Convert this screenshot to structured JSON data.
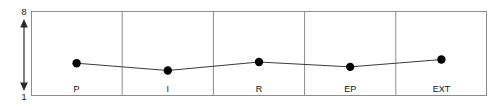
{
  "chart_data": {
    "type": "line",
    "title": "",
    "subtitle": "",
    "xlabel": "",
    "ylabel": "",
    "categories": [
      "P",
      "I",
      "R",
      "EP",
      "EXT"
    ],
    "values": [
      3.7,
      3.1,
      3.8,
      3.4,
      4.0
    ],
    "series": [
      {
        "name": "",
        "values": [
          3.7,
          3.1,
          3.8,
          3.4,
          4.0
        ]
      }
    ],
    "ylim": [
      1,
      8
    ],
    "y_axis_ticks": [
      "8",
      "1"
    ],
    "y_axis_max_label": "8",
    "y_axis_min_label": "1",
    "grid": false,
    "legend": false,
    "legend_position": "none",
    "annotations": [],
    "marker": "filled-circle",
    "marker_color": "#000000",
    "line_color": "#3a3a3a",
    "frame_color": "#8c8c8c",
    "divider_color": "#8c8c8c",
    "background_color": "#ffffff",
    "category_separators": true
  }
}
